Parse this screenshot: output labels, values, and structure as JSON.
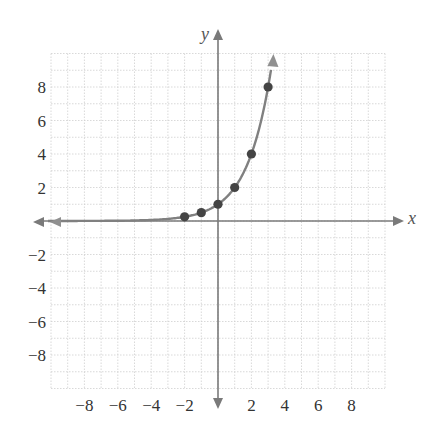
{
  "chart_data": {
    "type": "line",
    "title": "",
    "function": "y = 2^x",
    "xlabel": "x",
    "ylabel": "y",
    "xlim": [
      -10,
      10
    ],
    "ylim": [
      -10,
      10
    ],
    "grid": true,
    "x_ticks": [
      -8,
      -6,
      -4,
      -2,
      2,
      4,
      6,
      8
    ],
    "y_ticks": [
      8,
      6,
      4,
      2,
      -2,
      -4,
      -6,
      -8
    ],
    "x_tick_labels": [
      "−8",
      "−6",
      "−4",
      "−2",
      "2",
      "4",
      "6",
      "8"
    ],
    "y_tick_labels": [
      "8",
      "6",
      "4",
      "2",
      "−2",
      "−4",
      "−6",
      "−8"
    ],
    "points": [
      {
        "x": -2,
        "y": 0.25
      },
      {
        "x": -1,
        "y": 0.5
      },
      {
        "x": 0,
        "y": 1
      },
      {
        "x": 1,
        "y": 2
      },
      {
        "x": 2,
        "y": 4
      },
      {
        "x": 3,
        "y": 8
      }
    ],
    "curve_domain": [
      -10,
      3.2
    ],
    "colors": {
      "axis": "#7a7a7a",
      "curve": "#808080",
      "points": "#444444",
      "grid": "#cfcfcf",
      "text": "#333333"
    }
  }
}
